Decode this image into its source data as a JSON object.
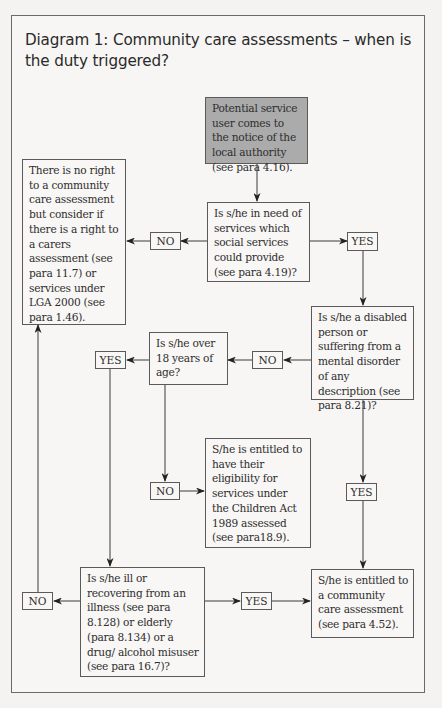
{
  "diagram": {
    "title": "Diagram 1: Community care assessments – when is the duty triggered?",
    "nodes": {
      "start": "Potential service user comes to the notice of the local authority (see para 4.16).",
      "q_need_services": "Is s/he in need of services which social services could provide (see para 4.19)?",
      "no_right": "There is no right to a community care assessment but consider if there is a right to a carers assessment (see para 11.7) or services under LGA 2000 (see para 1.46).",
      "q_disabled": "Is s/he a disabled person or suffering from a mental disorder of any description (see para 8.21)?",
      "q_over_18": "Is s/he over 18 years of age?",
      "children_act": "S/he is entitled to have their eligibility for services under the Children Act 1989 assessed (see para18.9).",
      "q_ill_elderly": "Is s/he ill or recovering from an illness (see para 8.128) or elderly (para 8.134) or a drug/ alcohol misuser (see para 16.7)?",
      "entitled": "S/he is entitled to a community care assessment (see para 4.52)."
    },
    "labels": {
      "no_1": "NO",
      "yes_1": "YES",
      "no_2": "NO",
      "yes_2": "YES",
      "no_3": "NO",
      "yes_3": "YES",
      "no_4": "NO",
      "yes_4": "YES"
    },
    "colors": {
      "start_fill": "#ababab",
      "line": "#3a3a3a",
      "border": "#5a5a5a"
    }
  }
}
